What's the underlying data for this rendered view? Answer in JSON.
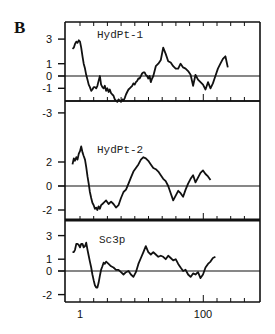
{
  "chart_data": {
    "type": "line",
    "figure_label": "B",
    "xlabel": "",
    "x_tick_labels": [
      "1",
      "100"
    ],
    "x_ticks_labeled": [
      1,
      100
    ],
    "xlim": [
      -11,
      146
    ],
    "panels": [
      {
        "name": "HydPt-1",
        "ylabel": "",
        "y_tick_labels": [
          "3",
          "1",
          "0",
          "-1",
          "-3"
        ],
        "y_ticks": [
          3,
          1,
          0,
          -1,
          -3
        ],
        "ylim": [
          -4,
          3.8
        ],
        "x": [
          -5,
          -4,
          -3,
          -2,
          -1,
          0,
          1,
          2,
          3,
          4,
          5,
          6,
          7,
          8,
          9,
          10,
          11,
          12,
          13,
          14,
          15,
          16,
          17,
          18,
          19,
          20,
          21,
          22,
          23,
          24,
          25,
          26,
          27,
          28,
          29,
          30,
          31,
          32,
          33,
          34,
          35,
          36,
          37,
          38,
          39,
          40,
          41,
          42,
          43,
          44,
          45,
          46,
          47,
          48,
          49,
          50,
          51,
          52,
          53,
          54,
          55,
          56,
          57,
          58,
          59,
          60,
          62,
          64,
          66,
          68,
          70,
          72,
          74,
          76,
          78,
          80,
          82,
          84,
          86,
          88,
          90,
          92,
          94,
          96,
          98,
          100,
          102,
          104,
          106,
          108,
          110,
          112,
          114,
          116,
          118,
          120,
          122,
          124,
          126,
          128,
          130,
          132,
          134,
          136,
          138,
          140
        ],
        "values": [
          2.2,
          2.3,
          2.6,
          2.8,
          2.7,
          2.9,
          2.8,
          2.3,
          1.6,
          1.0,
          0.6,
          0.1,
          -0.3,
          -0.7,
          -0.9,
          -1.2,
          -1.1,
          -0.9,
          -0.9,
          -1.0,
          -0.8,
          -0.4,
          0.0,
          -0.7,
          -0.9,
          -1.0,
          -0.8,
          -1.2,
          -1.0,
          -1.3,
          -1.1,
          -1.4,
          -1.5,
          -1.6,
          -1.9,
          -2.0,
          -2.1,
          -1.9,
          -2.0,
          -2.1,
          -1.9,
          -2.0,
          -1.8,
          -1.5,
          -1.3,
          -1.1,
          -1.0,
          -0.9,
          -0.8,
          -0.6,
          -0.7,
          -0.5,
          -0.4,
          -0.2,
          -0.2,
          0.0,
          0.2,
          0.3,
          0.3,
          0.1,
          0.0,
          -0.2,
          0.0,
          -0.5,
          -0.2,
          0.0,
          0.8,
          1.0,
          1.3,
          2.3,
          1.8,
          1.2,
          1.1,
          0.8,
          0.6,
          0.6,
          1.0,
          0.7,
          0.6,
          0.4,
          0.1,
          -0.8,
          0.1,
          -0.3,
          -0.5,
          -0.7,
          -1.1,
          -0.5,
          -1.0,
          -0.6,
          0.0,
          0.6,
          1.0,
          1.4,
          1.6,
          0.7
        ],
        "zero_line": 0
      },
      {
        "name": "HydPt-2",
        "ylabel": "",
        "y_tick_labels": [
          "2",
          "0",
          "-2"
        ],
        "y_ticks": [
          2,
          0,
          -2
        ],
        "ylim": [
          -2.9,
          3.6
        ],
        "x": [
          -5,
          -4,
          -3,
          -2,
          -1,
          0,
          1,
          2,
          3,
          4,
          5,
          6,
          7,
          8,
          9,
          10,
          11,
          12,
          13,
          14,
          15,
          16,
          17,
          18,
          19,
          20,
          22,
          24,
          26,
          28,
          30,
          32,
          34,
          36,
          38,
          40,
          42,
          44,
          46,
          48,
          50,
          52,
          54,
          56,
          58,
          60,
          62,
          64,
          66,
          68,
          70,
          72,
          74,
          76,
          78,
          80,
          82,
          84,
          86,
          88,
          90,
          92,
          94,
          96,
          98,
          100,
          102,
          104,
          106,
          108,
          110,
          112,
          114,
          116,
          118,
          120
        ],
        "values": [
          1.8,
          2.3,
          2.1,
          2.4,
          2.2,
          2.7,
          2.9,
          3.3,
          2.8,
          2.5,
          2.2,
          1.6,
          0.8,
          0.2,
          -0.5,
          -1.0,
          -1.4,
          -1.6,
          -1.9,
          -1.8,
          -2.0,
          -1.7,
          -1.9,
          -1.6,
          -1.5,
          -1.4,
          -1.2,
          -1.5,
          -1.3,
          -1.5,
          -1.8,
          -1.6,
          -1.0,
          -0.5,
          -0.3,
          0.2,
          0.7,
          1.2,
          1.5,
          1.8,
          2.2,
          2.4,
          2.3,
          2.1,
          1.8,
          1.5,
          1.4,
          1.2,
          0.9,
          0.6,
          0.4,
          0.0,
          -0.6,
          -1.2,
          -0.8,
          -0.4,
          -0.6,
          -0.9,
          -0.3,
          0.2,
          0.6,
          0.9,
          0.3,
          0.7,
          1.1,
          1.3,
          1.0,
          0.8,
          0.5
        ],
        "zero_line": 0
      },
      {
        "name": "Sc3p",
        "ylabel": "",
        "y_tick_labels": [
          "3",
          "1",
          "0",
          "-2"
        ],
        "y_ticks": [
          3,
          1,
          0,
          -2
        ],
        "ylim": [
          -2.8,
          3.8
        ],
        "x": [
          -5,
          -4,
          -3,
          -2,
          -1,
          0,
          1,
          2,
          3,
          4,
          5,
          6,
          7,
          8,
          9,
          10,
          11,
          12,
          13,
          14,
          15,
          16,
          17,
          18,
          19,
          20,
          21,
          22,
          24,
          26,
          28,
          30,
          32,
          34,
          36,
          38,
          40,
          42,
          44,
          46,
          48,
          50,
          52,
          54,
          56,
          58,
          60,
          62,
          64,
          66,
          68,
          70,
          72,
          74,
          76,
          78,
          80,
          82,
          84,
          86,
          88,
          90,
          92,
          94,
          96,
          98,
          100,
          102,
          104,
          106,
          108,
          110,
          112,
          114,
          116,
          118,
          120,
          122,
          124
        ],
        "values": [
          1.6,
          1.6,
          1.8,
          2.3,
          2.3,
          2.2,
          2.0,
          2.3,
          2.3,
          2.0,
          2.1,
          2.4,
          1.8,
          1.3,
          0.8,
          0.3,
          -0.3,
          -0.8,
          -1.2,
          -1.4,
          -1.4,
          -1.0,
          -0.4,
          0.1,
          0.4,
          0.7,
          0.6,
          0.8,
          0.6,
          0.4,
          0.3,
          0.1,
          0.1,
          -0.1,
          -0.3,
          -0.1,
          0.0,
          -0.3,
          -0.5,
          -0.1,
          0.6,
          1.1,
          1.6,
          2.1,
          1.6,
          1.4,
          1.6,
          1.4,
          1.2,
          1.3,
          1.2,
          1.0,
          1.3,
          1.1,
          0.9,
          1.0,
          0.6,
          0.3,
          0.0,
          0.1,
          -0.3,
          -0.5,
          -0.2,
          -0.3,
          -0.1,
          -0.6,
          -0.3,
          0.3,
          0.6,
          0.8,
          1.1,
          1.2
        ],
        "zero_line": 0
      }
    ]
  }
}
